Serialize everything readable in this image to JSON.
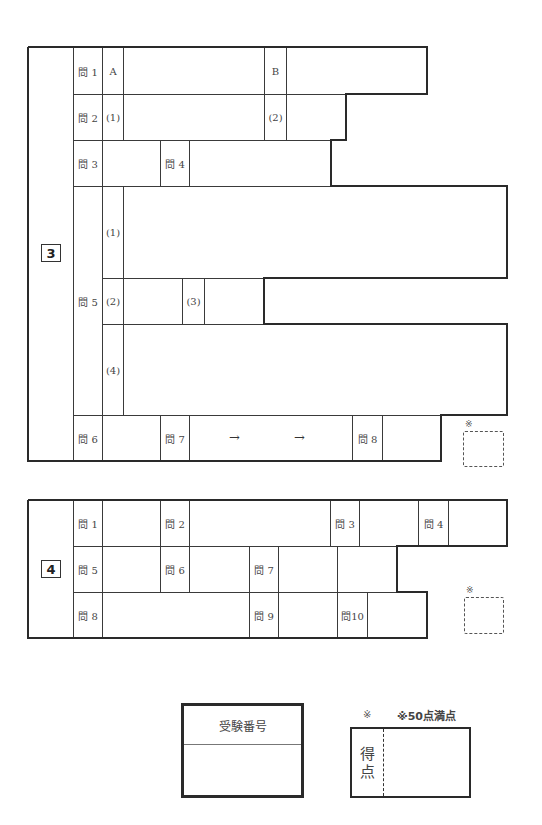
{
  "section3": {
    "number": "3",
    "q1": {
      "label": "問 1",
      "a": "A",
      "b": "B"
    },
    "q2": {
      "label": "問 2",
      "sub1": "(1)",
      "sub2": "(2)"
    },
    "q3": {
      "label": "問 3"
    },
    "q4": {
      "label": "問 4"
    },
    "q5": {
      "label": "問 5",
      "sub1": "(1)",
      "sub2": "(2)",
      "sub3": "(3)",
      "sub4": "(4)"
    },
    "q6": {
      "label": "問 6"
    },
    "q7": {
      "label": "問 7",
      "arrow1": "→",
      "arrow2": "→"
    },
    "q8": {
      "label": "問 8"
    },
    "note_mark": "※"
  },
  "section4": {
    "number": "4",
    "q1": {
      "label": "問 1"
    },
    "q2": {
      "label": "問 2"
    },
    "q3": {
      "label": "問 3"
    },
    "q4": {
      "label": "問 4"
    },
    "q5": {
      "label": "問 5"
    },
    "q6": {
      "label": "問 6"
    },
    "q7": {
      "label": "問 7"
    },
    "q8": {
      "label": "問 8"
    },
    "q9": {
      "label": "問 9"
    },
    "q10": {
      "label": "問10"
    },
    "note_mark": "※"
  },
  "exam_number_box": {
    "label": "受験番号"
  },
  "score_box": {
    "mark": "※",
    "full_score_note": "※50点満点",
    "label_line1": "得",
    "label_line2": "点"
  }
}
